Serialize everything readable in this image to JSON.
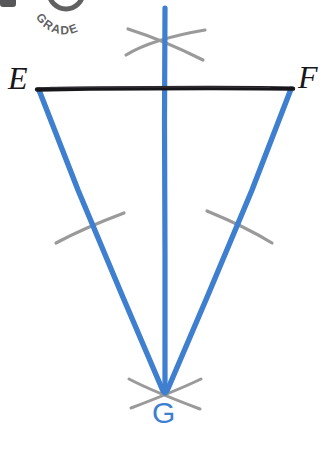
{
  "canvas": {
    "width": 326,
    "height": 473,
    "background": "#ffffff"
  },
  "colors": {
    "segment_black": "#17161a",
    "construction_blue": "#3f7fcf",
    "arc_gray": "#9a9a9a",
    "label_black": "#17161a",
    "label_blue": "#3f7fcf",
    "background": "#ffffff",
    "watermark_gray": "#3a3a3c"
  },
  "labels": {
    "E": "E",
    "F": "F",
    "G": "G"
  },
  "points": {
    "E": {
      "x": 38,
      "y": 89
    },
    "F": {
      "x": 292,
      "y": 88
    },
    "G": {
      "x": 165,
      "y": 393
    },
    "line_top": {
      "x": 165,
      "y": 8
    }
  },
  "segments": [
    {
      "name": "segment-EF",
      "from": "E",
      "to": "F",
      "color": "#17161a",
      "width": 4,
      "style": "hand-drawn"
    },
    {
      "name": "segment-EG",
      "from": "E",
      "to": "G",
      "color": "#3f7fcf",
      "width": 5,
      "style": "hand-drawn"
    },
    {
      "name": "segment-FG",
      "from": "F",
      "to": "G",
      "color": "#3f7fcf",
      "width": 5,
      "style": "hand-drawn"
    },
    {
      "name": "vertical-bisector",
      "from": "line_top",
      "to": "G",
      "color": "#3f7fcf",
      "width": 5,
      "style": "hand-drawn"
    }
  ],
  "construction_arcs": [
    {
      "name": "arc-top-left",
      "description": "upper arc sweeping from lower-left to upper-right, crossing the vertical line above EF"
    },
    {
      "name": "arc-top-right",
      "description": "upper arc sweeping from upper-left to lower-right, crossing the vertical line above EF"
    },
    {
      "name": "arc-mid-left",
      "description": "arc crossing segment EG at its midpoint region"
    },
    {
      "name": "arc-mid-right",
      "description": "arc crossing segment FG at its midpoint region"
    },
    {
      "name": "arc-bottom-left",
      "description": "arc crossing through vertex G from upper-left to lower-right"
    },
    {
      "name": "arc-bottom-right",
      "description": "arc crossing through vertex G from lower-left to upper-right"
    }
  ],
  "watermark": {
    "text": "GRADE",
    "description": "partial circular stamp watermark cropped at top edge"
  }
}
